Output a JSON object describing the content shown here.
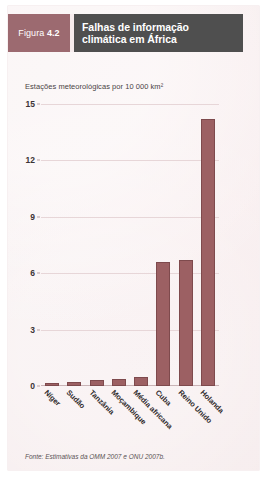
{
  "figure": {
    "label_prefix": "Figura",
    "number": "4.2",
    "title": "Falhas de informação climática em África",
    "source": "Fonte: Estimativas da OMM 2007 e ONU 2007b."
  },
  "colors": {
    "bar": "#9c6063",
    "bar_edge": "#7e4a4d",
    "figure_number_box": "#9c6a70",
    "title_box": "#4f4f4f",
    "panel_background": "#f6eced",
    "gridline": "#e7d6d8"
  },
  "chart_data": {
    "type": "bar",
    "title": "Falhas de informação climática em África",
    "subtitle": "Estações meteorológicas por 10 000 km²",
    "xlabel": "",
    "ylabel": "Estações meteorológicas por 10 000 km²",
    "ylim": [
      0,
      15
    ],
    "yticks": [
      0,
      3,
      6,
      9,
      12,
      15
    ],
    "ytick_labels": [
      "0",
      "3",
      "6",
      "9",
      "12",
      "15"
    ],
    "grid": true,
    "legend": "none",
    "categories": [
      "Níger",
      "Sudão",
      "Tanzânia",
      "Moçambique",
      "Média africana",
      "Cuba",
      "Reino Unido",
      "Holanda"
    ],
    "values": [
      0.15,
      0.2,
      0.3,
      0.35,
      0.5,
      6.6,
      6.7,
      14.2
    ],
    "source": "Fonte: Estimativas da OMM 2007 e ONU 2007b."
  }
}
